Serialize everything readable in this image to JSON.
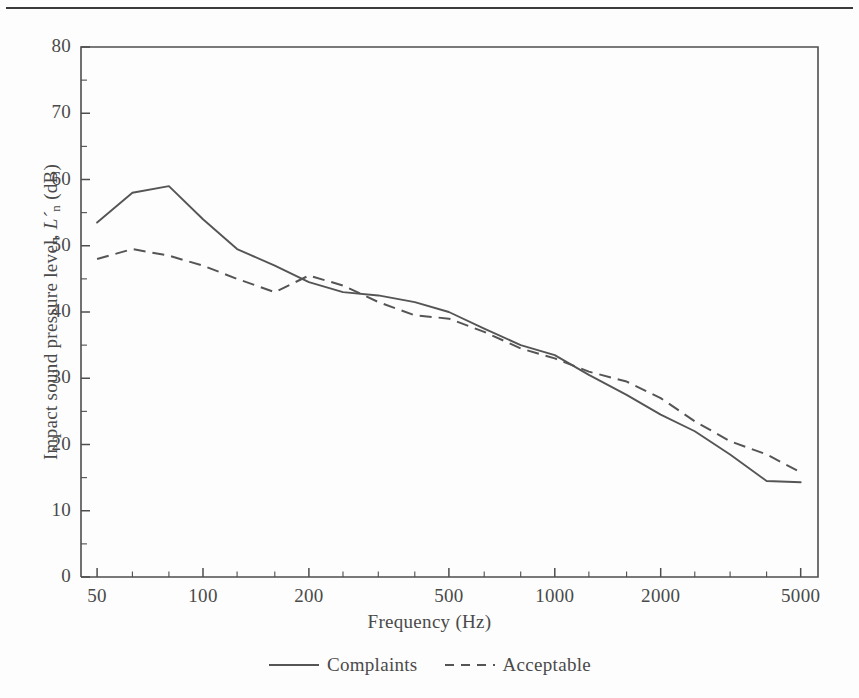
{
  "chart_data": {
    "type": "line",
    "title": "",
    "xlabel": "Frequency (Hz)",
    "ylabel": "Impact sound pressure level, L´n (dB)",
    "xscale": "log",
    "xlim": [
      45,
      5600
    ],
    "ylim": [
      0,
      80
    ],
    "ytick_step": 10,
    "grid": false,
    "legend_position": "bottom-center",
    "xticks": [
      50,
      100,
      200,
      500,
      1000,
      2000,
      5000
    ],
    "xtick_labels": [
      "50",
      "100",
      "200",
      "500",
      "1000",
      "2000",
      "5000"
    ],
    "xminor_ticks": [
      63,
      80,
      125,
      160,
      250,
      315,
      400,
      630,
      800,
      1250,
      1600,
      2500,
      3150,
      4000
    ],
    "yticks": [
      0,
      10,
      20,
      30,
      40,
      50,
      60,
      70,
      80
    ],
    "ytick_labels": [
      "0",
      "10",
      "20",
      "30",
      "40",
      "50",
      "60",
      "70",
      "80"
    ],
    "x": [
      50,
      63,
      80,
      100,
      125,
      160,
      200,
      250,
      315,
      400,
      500,
      630,
      800,
      1000,
      1250,
      1600,
      2000,
      2500,
      3150,
      4000,
      5000
    ],
    "series": [
      {
        "name": "Complaints",
        "style": "solid",
        "values": [
          53.5,
          58.0,
          59.0,
          54.0,
          49.5,
          47.0,
          44.5,
          43.0,
          42.5,
          41.5,
          40.0,
          37.5,
          35.0,
          33.5,
          30.5,
          27.5,
          24.5,
          22.0,
          18.5,
          14.5,
          14.3
        ]
      },
      {
        "name": "Acceptable",
        "style": "dashed",
        "values": [
          48.0,
          49.5,
          48.5,
          47.0,
          45.0,
          43.0,
          45.5,
          44.0,
          41.5,
          39.5,
          39.0,
          37.0,
          34.5,
          33.0,
          31.0,
          29.5,
          27.0,
          23.5,
          20.5,
          18.5,
          15.8
        ]
      }
    ]
  },
  "legend": {
    "entries": [
      {
        "label": "Complaints",
        "style": "solid"
      },
      {
        "label": "Acceptable",
        "style": "dashed"
      }
    ]
  },
  "axis": {
    "x_title": "Frequency (Hz)",
    "y_title_pre": "Impact sound pressure level, ",
    "y_title_sym": "L´",
    "y_title_sub": "n",
    "y_title_post": " (dB)"
  }
}
